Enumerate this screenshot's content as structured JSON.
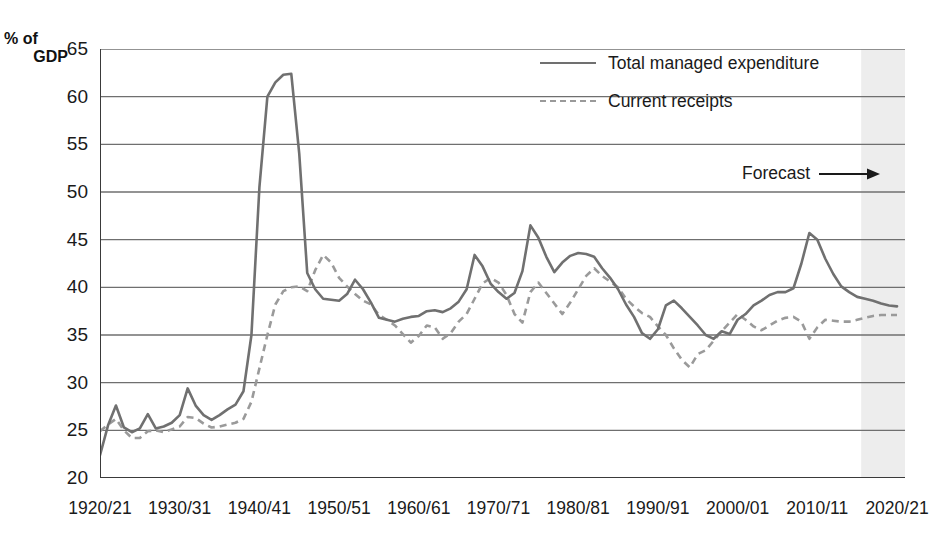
{
  "chart_data": {
    "type": "line",
    "title": "",
    "xlabel": "",
    "ylabel": "% of GDP",
    "ylabel_line1": "% of",
    "ylabel_line2": "GDP",
    "ylim": [
      20,
      65
    ],
    "yticks": [
      20,
      25,
      30,
      35,
      40,
      45,
      50,
      55,
      60,
      65
    ],
    "ytick_labels": [
      "20",
      "25",
      "30",
      "35",
      "40",
      "45",
      "50",
      "55",
      "60",
      "65"
    ],
    "xlim": [
      1920,
      2021
    ],
    "xticks": [
      1920,
      1930,
      1940,
      1950,
      1960,
      1970,
      1980,
      1990,
      2000,
      2010,
      2020
    ],
    "xtick_labels": [
      "1920/21",
      "1930/31",
      "1940/41",
      "1950/51",
      "1960/61",
      "1970/71",
      "1980/81",
      "1990/91",
      "2000/01",
      "2010/11",
      "2020/21"
    ],
    "grid": "horizontal",
    "legend_position": "top-right",
    "annotations": [
      {
        "text": "Forecast",
        "arrow": "right",
        "x": 2016
      }
    ],
    "shaded_regions": [
      {
        "name": "forecast-band",
        "x_start": 2015.5,
        "x_end": 2021,
        "color": "#eeeeee"
      }
    ],
    "colors": {
      "expenditure": "#707070",
      "receipts": "#9a9a9a",
      "gridline": "#6f6f6f",
      "axis": "#3a3a3a",
      "forecast_band": "#ededed",
      "text": "#1a1a1a"
    },
    "x": [
      1920,
      1921,
      1922,
      1923,
      1924,
      1925,
      1926,
      1927,
      1928,
      1929,
      1930,
      1931,
      1932,
      1933,
      1934,
      1935,
      1936,
      1937,
      1938,
      1939,
      1940,
      1941,
      1942,
      1943,
      1944,
      1945,
      1946,
      1947,
      1948,
      1949,
      1950,
      1951,
      1952,
      1953,
      1954,
      1955,
      1956,
      1957,
      1958,
      1959,
      1960,
      1961,
      1962,
      1963,
      1964,
      1965,
      1966,
      1967,
      1968,
      1969,
      1970,
      1971,
      1972,
      1973,
      1974,
      1975,
      1976,
      1977,
      1978,
      1979,
      1980,
      1981,
      1982,
      1983,
      1984,
      1985,
      1986,
      1987,
      1988,
      1989,
      1990,
      1991,
      1992,
      1993,
      1994,
      1995,
      1996,
      1997,
      1998,
      1999,
      2000,
      2001,
      2002,
      2003,
      2004,
      2005,
      2006,
      2007,
      2008,
      2009,
      2010,
      2011,
      2012,
      2013,
      2014,
      2015,
      2016,
      2017,
      2018,
      2019,
      2020
    ],
    "series": [
      {
        "name": "Total managed expenditure",
        "style": "solid",
        "color": "#707070",
        "values": [
          22.4,
          25.5,
          27.6,
          25.3,
          24.8,
          25.2,
          26.7,
          25.2,
          25.4,
          25.8,
          26.6,
          29.4,
          27.6,
          26.6,
          26.1,
          26.6,
          27.2,
          27.7,
          29.1,
          35.0,
          50.5,
          60.0,
          61.5,
          62.3,
          62.4,
          54.0,
          41.5,
          39.8,
          38.8,
          38.7,
          38.6,
          39.3,
          40.8,
          39.8,
          38.4,
          36.8,
          36.6,
          36.4,
          36.7,
          36.9,
          37.0,
          37.5,
          37.6,
          37.4,
          37.8,
          38.5,
          39.8,
          43.4,
          42.2,
          40.4,
          39.5,
          38.8,
          39.4,
          41.7,
          46.5,
          45.2,
          43.2,
          41.6,
          42.6,
          43.3,
          43.6,
          43.5,
          43.2,
          42.0,
          41.0,
          39.8,
          38.2,
          36.9,
          35.2,
          34.6,
          35.6,
          38.1,
          38.6,
          37.8,
          36.9,
          36.0,
          35.0,
          34.6,
          35.4,
          35.1,
          36.6,
          37.2,
          38.1,
          38.6,
          39.2,
          39.5,
          39.5,
          39.9,
          42.5,
          45.7,
          45.0,
          43.0,
          41.4,
          40.1,
          39.5,
          39.0,
          38.8,
          38.6,
          38.3,
          38.1,
          38.0
        ]
      },
      {
        "name": "Current receipts",
        "style": "dashed",
        "color": "#9a9a9a",
        "values": [
          24.9,
          25.6,
          26.2,
          25.0,
          24.2,
          24.2,
          24.9,
          25.0,
          24.8,
          25.1,
          25.4,
          26.4,
          26.3,
          25.7,
          25.3,
          25.4,
          25.6,
          25.8,
          26.2,
          28.0,
          31.5,
          35.0,
          38.2,
          39.6,
          40.0,
          40.1,
          39.6,
          41.8,
          43.4,
          42.6,
          41.0,
          40.1,
          39.3,
          38.6,
          38.2,
          37.1,
          36.6,
          36.0,
          35.1,
          34.2,
          34.9,
          36.0,
          35.8,
          34.6,
          35.2,
          36.4,
          37.2,
          38.8,
          40.4,
          41.0,
          40.5,
          39.2,
          37.2,
          36.3,
          39.5,
          40.5,
          39.4,
          38.3,
          37.2,
          38.4,
          39.8,
          41.2,
          42.0,
          41.2,
          40.6,
          40.0,
          38.8,
          38.0,
          37.3,
          36.9,
          35.9,
          35.0,
          33.6,
          32.4,
          31.6,
          33.0,
          33.4,
          34.4,
          35.4,
          36.3,
          37.2,
          36.6,
          35.9,
          35.5,
          36.0,
          36.5,
          36.8,
          36.9,
          36.4,
          34.6,
          35.8,
          36.6,
          36.5,
          36.4,
          36.4,
          36.6,
          36.8,
          37.0,
          37.1,
          37.1,
          37.1
        ]
      }
    ]
  }
}
